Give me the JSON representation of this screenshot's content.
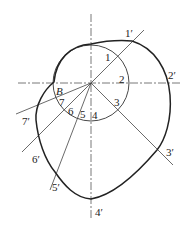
{
  "diagram": {
    "type": "cam-profile-construction",
    "center": {
      "x": 91,
      "y": 83
    },
    "base_circle_radius": 38,
    "colors": {
      "line": "#333333",
      "profile": "#222222"
    },
    "point_labels": {
      "B": "B",
      "inner": [
        "1",
        "2",
        "3",
        "4",
        "5",
        "6",
        "7"
      ],
      "outer": [
        "1′",
        "2′",
        "3′",
        "4′",
        "5′",
        "6′",
        "7′"
      ]
    }
  }
}
